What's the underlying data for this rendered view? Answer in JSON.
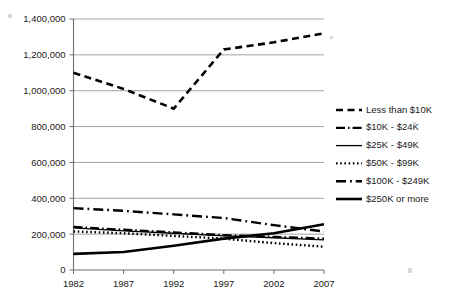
{
  "chart_data": {
    "type": "line",
    "title": "",
    "xlabel": "",
    "ylabel": "",
    "categories": [
      "1982",
      "1987",
      "1992",
      "1997",
      "2002",
      "2007"
    ],
    "x": [
      1982,
      1987,
      1992,
      1997,
      2002,
      2007
    ],
    "xlim": [
      1982,
      2007
    ],
    "ylim": [
      0,
      1400000
    ],
    "grid": true,
    "legend_position": "right",
    "ytick_labels": [
      "1,400,000",
      "1,200,000",
      "1,000,000",
      "800,000",
      "600,000",
      "400,000",
      "200,000",
      "0"
    ],
    "ytick_values": [
      1400000,
      1200000,
      1000000,
      800000,
      600000,
      400000,
      200000,
      0
    ],
    "series": [
      {
        "name": "Less than $10K",
        "style": "dashed",
        "values": [
          1100000,
          1010000,
          900000,
          1230000,
          1270000,
          1320000
        ]
      },
      {
        "name": "$10K - $24K",
        "style": "dash-dot-long",
        "values": [
          240000,
          225000,
          210000,
          195000,
          185000,
          175000
        ]
      },
      {
        "name": "$25K - $49K",
        "style": "solid-thin",
        "values": [
          235000,
          218000,
          205000,
          190000,
          180000,
          168000
        ]
      },
      {
        "name": "$50K - $99K",
        "style": "dotted",
        "values": [
          215000,
          205000,
          190000,
          175000,
          150000,
          130000
        ]
      },
      {
        "name": "$100K - $249K",
        "style": "dash-dot",
        "values": [
          345000,
          330000,
          310000,
          290000,
          250000,
          215000
        ]
      },
      {
        "name": "$250K or more",
        "style": "solid-thick",
        "values": [
          90000,
          100000,
          135000,
          175000,
          205000,
          255000
        ]
      }
    ]
  },
  "legend": {
    "items": [
      {
        "label": "Less than $10K",
        "style": "dashed"
      },
      {
        "label": "$10K - $24K",
        "style": "dash-dot-long"
      },
      {
        "label": "$25K - $49K",
        "style": "solid-thin"
      },
      {
        "label": "$50K - $99K",
        "style": "dotted"
      },
      {
        "label": "$100K - $249K",
        "style": "dash-dot"
      },
      {
        "label": "$250K or more",
        "style": "solid-thick"
      }
    ]
  },
  "colors": {
    "series": "#000000",
    "gridline": "#9a9a9a",
    "axis": "#6e6e6e",
    "text": "#1a1a1a",
    "background": "#ffffff"
  }
}
